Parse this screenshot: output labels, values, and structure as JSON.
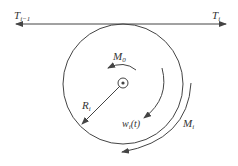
{
  "diagram": {
    "labels": {
      "tension_left": "T",
      "tension_left_sub": "i−1",
      "tension_right": "T",
      "tension_right_sub": "i",
      "moment_center": "M",
      "moment_center_sub": "0",
      "radius": "R",
      "radius_sub": "i",
      "angular_velocity": "w",
      "angular_velocity_sub": "i",
      "angular_velocity_arg": "(t)",
      "moment_outer": "M",
      "moment_outer_sub": "i"
    },
    "colors": {
      "stroke": "#444444",
      "text": "#333333"
    }
  }
}
